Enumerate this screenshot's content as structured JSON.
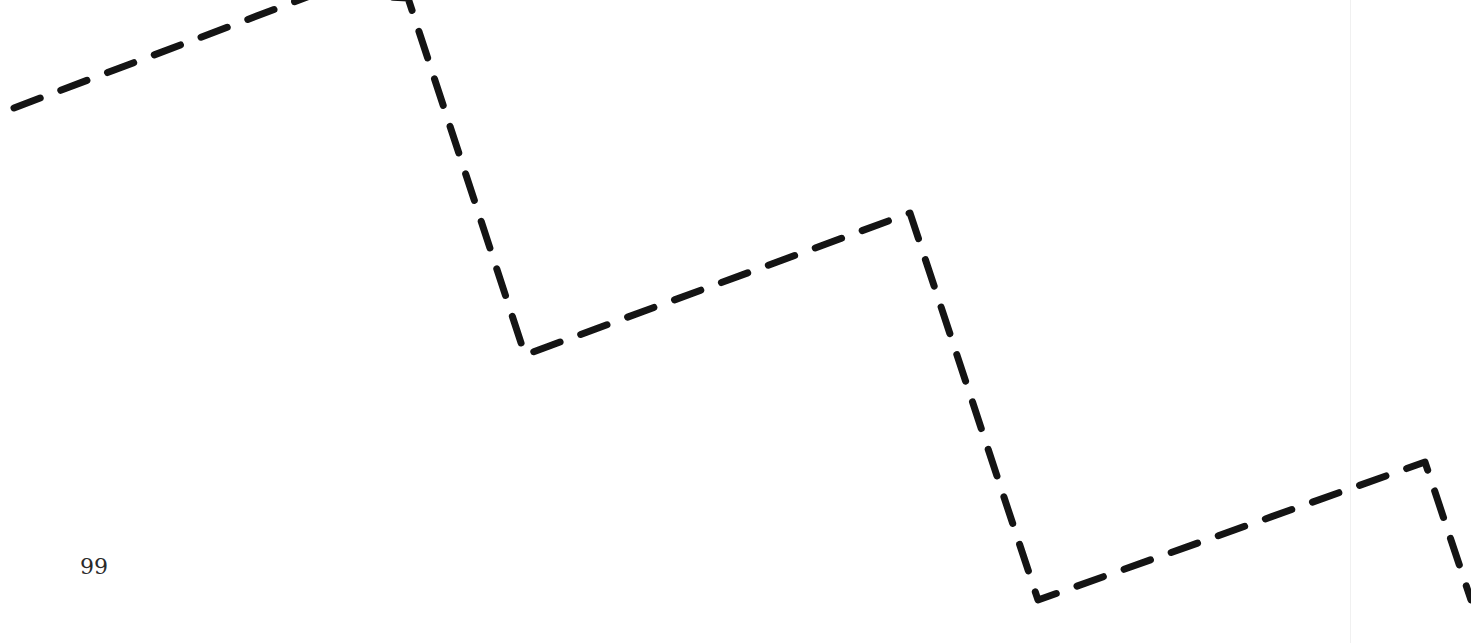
{
  "page": {
    "number": "99",
    "background": "#ffffff"
  },
  "figure": {
    "type": "dashed-zigzag-line",
    "stroke_color": "#141414",
    "points": [
      [
        14,
        108
      ],
      [
        315,
        -6
      ],
      [
        408,
        -2
      ],
      [
        525,
        355
      ],
      [
        910,
        213
      ],
      [
        1038,
        600
      ],
      [
        1425,
        462
      ],
      [
        1471,
        600
      ]
    ]
  }
}
